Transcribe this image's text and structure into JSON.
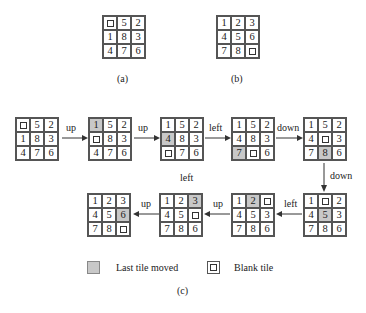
{
  "figures": {
    "a": {
      "caption": "(a)",
      "tiles": [
        "B",
        "5",
        "2",
        "1",
        "8",
        "3",
        "4",
        "7",
        "6"
      ]
    },
    "b": {
      "caption": "(b)",
      "tiles": [
        "1",
        "2",
        "3",
        "4",
        "5",
        "6",
        "7",
        "8",
        "B"
      ]
    },
    "c": {
      "caption": "(c)",
      "sequence": [
        {
          "tiles": [
            "B",
            "5",
            "2",
            "1",
            "8",
            "3",
            "4",
            "7",
            "6"
          ],
          "moved_index": null
        },
        {
          "tiles": [
            "1",
            "5",
            "2",
            "B",
            "8",
            "3",
            "4",
            "7",
            "6"
          ],
          "moved_index": 0
        },
        {
          "tiles": [
            "1",
            "5",
            "2",
            "4",
            "8",
            "3",
            "B",
            "7",
            "6"
          ],
          "moved_index": 3
        },
        {
          "tiles": [
            "1",
            "5",
            "2",
            "4",
            "8",
            "3",
            "7",
            "B",
            "6"
          ],
          "moved_index": 6
        },
        {
          "tiles": [
            "1",
            "5",
            "2",
            "4",
            "B",
            "3",
            "7",
            "8",
            "6"
          ],
          "moved_index": 7
        },
        {
          "tiles": [
            "1",
            "B",
            "2",
            "4",
            "5",
            "3",
            "7",
            "8",
            "6"
          ],
          "moved_index": 4
        },
        {
          "tiles": [
            "1",
            "2",
            "B",
            "4",
            "5",
            "3",
            "7",
            "8",
            "6"
          ],
          "moved_index": 1
        },
        {
          "tiles": [
            "1",
            "2",
            "3",
            "4",
            "5",
            "B",
            "7",
            "8",
            "6"
          ],
          "moved_index": 2
        },
        {
          "tiles": [
            "1",
            "2",
            "3",
            "4",
            "5",
            "6",
            "7",
            "8",
            "B"
          ],
          "moved_index": 5
        }
      ],
      "moves": [
        "up",
        "up",
        "left",
        "down",
        "down",
        "left",
        "up",
        "up"
      ],
      "floating_label": "left"
    }
  },
  "legend": {
    "last_tile_moved": "Last tile moved",
    "blank_tile": "Blank tile"
  },
  "colors": {
    "moved_tile": "#c8c8c8",
    "grid_line": "#555555"
  }
}
